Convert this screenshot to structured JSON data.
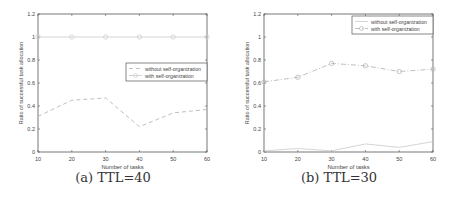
{
  "chart_data": [
    {
      "type": "line",
      "caption": "(a) TTL=40",
      "title": "",
      "xlabel": "Number of tasks",
      "ylabel": "Ratio of successful task allocation",
      "x": [
        10,
        20,
        30,
        40,
        50,
        60
      ],
      "xticks": [
        "10",
        "20",
        "30",
        "40",
        "50",
        "60"
      ],
      "yticks": [
        "0",
        "0.2",
        "0.4",
        "0.6",
        "0.8",
        "1",
        "1.2"
      ],
      "xlim": [
        10,
        60
      ],
      "ylim": [
        0,
        1.2
      ],
      "grid": false,
      "legend_position": "center-right",
      "series": [
        {
          "name": "without self-organization",
          "values": [
            0.31,
            0.45,
            0.47,
            0.22,
            0.34,
            0.37
          ],
          "style": "dashed",
          "marker": "none",
          "color": "#b8b8b8"
        },
        {
          "name": "with self-organization",
          "values": [
            1.0,
            1.0,
            1.0,
            1.0,
            1.0,
            1.0
          ],
          "style": "solid",
          "marker": "circle",
          "color": "#d0d0d0"
        }
      ]
    },
    {
      "type": "line",
      "caption": "(b) TTL=30",
      "title": "",
      "xlabel": "Number of tasks",
      "ylabel": "Ratio of successful task allocation",
      "x": [
        10,
        20,
        30,
        40,
        50,
        60
      ],
      "xticks": [
        "10",
        "20",
        "30",
        "40",
        "50",
        "60"
      ],
      "yticks": [
        "0",
        "0.2",
        "0.4",
        "0.6",
        "0.8",
        "1",
        "1.2"
      ],
      "xlim": [
        10,
        60
      ],
      "ylim": [
        0,
        1.2
      ],
      "grid": false,
      "legend_position": "upper-right",
      "series": [
        {
          "name": "without self-organization",
          "values": [
            0.01,
            0.03,
            0.01,
            0.07,
            0.04,
            0.09
          ],
          "style": "solid",
          "marker": "none",
          "color": "#d0d0d0"
        },
        {
          "name": "with self-organization",
          "values": [
            0.61,
            0.65,
            0.77,
            0.75,
            0.7,
            0.72
          ],
          "style": "dashdot",
          "marker": "circle",
          "color": "#b8b8b8"
        }
      ]
    }
  ]
}
